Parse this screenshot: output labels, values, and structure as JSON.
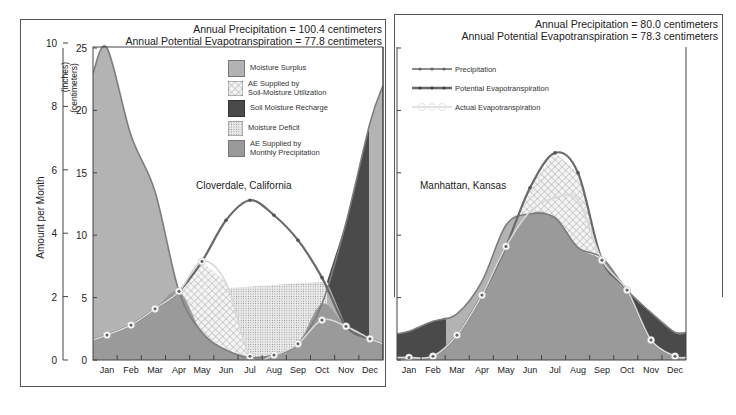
{
  "colors": {
    "surplus": "#b3b3b3",
    "monthly_precip_ae": "#9a9a9a",
    "recharge": "#4a4a4a",
    "deficit_bg": "#e6e6e6",
    "soil_util_bg": "#f2f2f2",
    "pe_line": "#6e6e6e",
    "precip_line": "#8c8c8c"
  },
  "left": {
    "annual_precip": "Annual Precipitation = 100.4 centimeters",
    "annual_pe": "Annual Potential Evapotranspiration = 77.8 centimeters",
    "station": "Cloverdale, California",
    "legend": [
      {
        "label": "Moisture Surplus",
        "swatch": "surplus"
      },
      {
        "label": "AE Supplied by",
        "label2": "Soil-Moisture Utilization",
        "swatch": "soil_util"
      },
      {
        "label": "Soil Moisture Recharge",
        "swatch": "recharge"
      },
      {
        "label": "Moisture Deficit",
        "swatch": "deficit"
      },
      {
        "label": "AE Supplied by",
        "label2": "Monthly Precipitation",
        "swatch": "monthly"
      }
    ]
  },
  "right": {
    "annual_precip": "Annual Precipitation = 80.0 centimeters",
    "annual_pe": "Annual Potential Evapotranspiration = 78.3 centimeters",
    "station": "Manhattan, Kansas",
    "legend": [
      {
        "label": "Precipitation"
      },
      {
        "label": "Potential Evapotranspiration"
      },
      {
        "label": "Actual Evapotranspiration"
      }
    ]
  },
  "axis": {
    "ylabel": "Amount per Month",
    "inches_label": "(inches)",
    "cm_label": "(centimeters)",
    "inch_ticks": [
      "0",
      "2",
      "4",
      "6",
      "8",
      "10"
    ],
    "cm_ticks": [
      "0",
      "5",
      "10",
      "15",
      "20",
      "25"
    ]
  },
  "chart_data": [
    {
      "type": "area",
      "title": "Cloverdale, California",
      "categories": [
        "Jan",
        "Feb",
        "Mar",
        "Apr",
        "May",
        "Jun",
        "Jul",
        "Aug",
        "Sep",
        "Oct",
        "Nov",
        "Dec"
      ],
      "ylabel": "Amount per Month (centimeters)",
      "ylim": [
        0,
        25
      ],
      "secondary_ylabel": "Amount per Month (inches)",
      "secondary_ylim": [
        0,
        10
      ],
      "annual_precipitation_cm": 100.4,
      "annual_potential_evapotranspiration_cm": 77.8,
      "series": [
        {
          "name": "Precipitation",
          "values": [
            25.0,
            18.0,
            13.5,
            5.5,
            2.2,
            0.8,
            0.2,
            0.4,
            1.3,
            4.5,
            11.0,
            19.0
          ]
        },
        {
          "name": "Potential Evapotranspiration",
          "values": [
            2.0,
            2.8,
            4.1,
            5.5,
            7.9,
            11.2,
            12.8,
            11.6,
            9.6,
            6.6,
            2.7,
            1.7
          ]
        },
        {
          "name": "Actual Evapotranspiration",
          "values": [
            2.0,
            2.8,
            4.1,
            5.5,
            7.9,
            6.2,
            0.3,
            0.4,
            1.3,
            3.2,
            2.7,
            1.7
          ]
        }
      ],
      "legend": [
        "Moisture Surplus",
        "AE Supplied by Soil-Moisture Utilization",
        "Soil Moisture Recharge",
        "Moisture Deficit",
        "AE Supplied by Monthly Precipitation"
      ],
      "grid": false
    },
    {
      "type": "area",
      "title": "Manhattan, Kansas",
      "categories": [
        "Jan",
        "Feb",
        "Mar",
        "Apr",
        "May",
        "Jun",
        "Jul",
        "Aug",
        "Sep",
        "Oct",
        "Nov",
        "Dec"
      ],
      "ylabel": "Amount per Month (centimeters)",
      "ylim": [
        0,
        25
      ],
      "annual_precipitation_cm": 80.0,
      "annual_potential_evapotranspiration_cm": 78.3,
      "series": [
        {
          "name": "Precipitation",
          "values": [
            2.3,
            3.1,
            3.7,
            6.3,
            10.8,
            11.7,
            11.4,
            9.0,
            8.2,
            5.6,
            3.8,
            2.2
          ]
        },
        {
          "name": "Potential Evapotranspiration",
          "values": [
            0.2,
            0.3,
            2.0,
            5.2,
            9.1,
            13.8,
            16.6,
            15.0,
            8.0,
            5.6,
            1.6,
            0.3
          ]
        },
        {
          "name": "Actual Evapotranspiration",
          "values": [
            0.2,
            0.3,
            2.0,
            5.2,
            9.1,
            11.9,
            13.0,
            12.8,
            8.0,
            5.6,
            1.6,
            0.3
          ]
        }
      ],
      "legend": [
        "Precipitation",
        "Potential Evapotranspiration",
        "Actual Evapotranspiration"
      ],
      "grid": false
    }
  ]
}
